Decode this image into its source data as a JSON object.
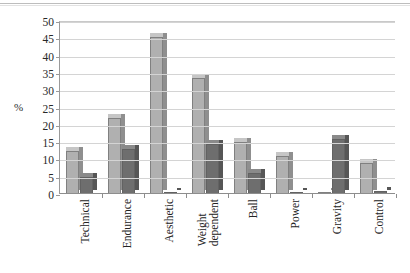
{
  "chart_data": {
    "type": "bar",
    "title": "",
    "xlabel": "",
    "ylabel": "%",
    "ylim": [
      0,
      50
    ],
    "yticks": [
      0,
      5,
      10,
      15,
      20,
      25,
      30,
      35,
      40,
      45,
      50
    ],
    "grid": true,
    "legend": "none",
    "categories": [
      "Technical",
      "Endurance",
      "Aesthetic",
      "Weight dependent",
      "Ball",
      "Power",
      "Gravity",
      "Control"
    ],
    "series": [
      {
        "name": "Series 1",
        "color": "#b0b0b0",
        "values": [
          12.5,
          22,
          45.5,
          33.5,
          15,
          11,
          0.5,
          9
        ]
      },
      {
        "name": "Series 2",
        "color": "#6e6e6e",
        "values": [
          5,
          13,
          0.5,
          14.5,
          6,
          0.5,
          16,
          1
        ]
      }
    ]
  },
  "axis": {
    "y_title": "%"
  },
  "colors": {
    "series1": "#b0b0b0",
    "series2": "#6e6e6e",
    "grid": "#d4d4d4",
    "axis": "#8d8d8d",
    "text": "#232323",
    "background": "#ffffff"
  }
}
